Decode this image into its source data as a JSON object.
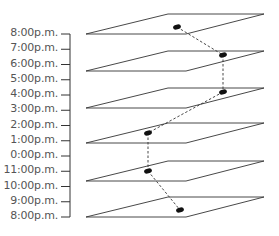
{
  "diagram": {
    "type": "stacked-time-planes",
    "time_axis": {
      "labels": [
        "8:00p.m.",
        "7:00p.m.",
        "6:00p.m.",
        "5:00p.m.",
        "4:00p.m.",
        "3:00p.m.",
        "2:00p.m.",
        "1:00p.m.",
        "0:00p.m.",
        "11:00p.m.",
        "10:00p.m.",
        "9:00p.m.",
        "8:00p.m."
      ],
      "label_color": "#555555",
      "axis_color": "#333333"
    },
    "planes": [
      {
        "id": "plane-1",
        "y": 14,
        "point": {
          "x": 177,
          "y": 27
        }
      },
      {
        "id": "plane-2",
        "y": 51,
        "point": {
          "x": 223,
          "y": 55
        }
      },
      {
        "id": "plane-3",
        "y": 88,
        "point": {
          "x": 223,
          "y": 92
        }
      },
      {
        "id": "plane-4",
        "y": 123,
        "point": {
          "x": 148,
          "y": 133
        }
      },
      {
        "id": "plane-5",
        "y": 161,
        "point": {
          "x": 148,
          "y": 171
        }
      },
      {
        "id": "plane-6",
        "y": 197,
        "point": {
          "x": 180,
          "y": 210
        }
      }
    ],
    "trajectory_style": "dashed",
    "line_color": "#333333",
    "point_color": "#111111"
  }
}
